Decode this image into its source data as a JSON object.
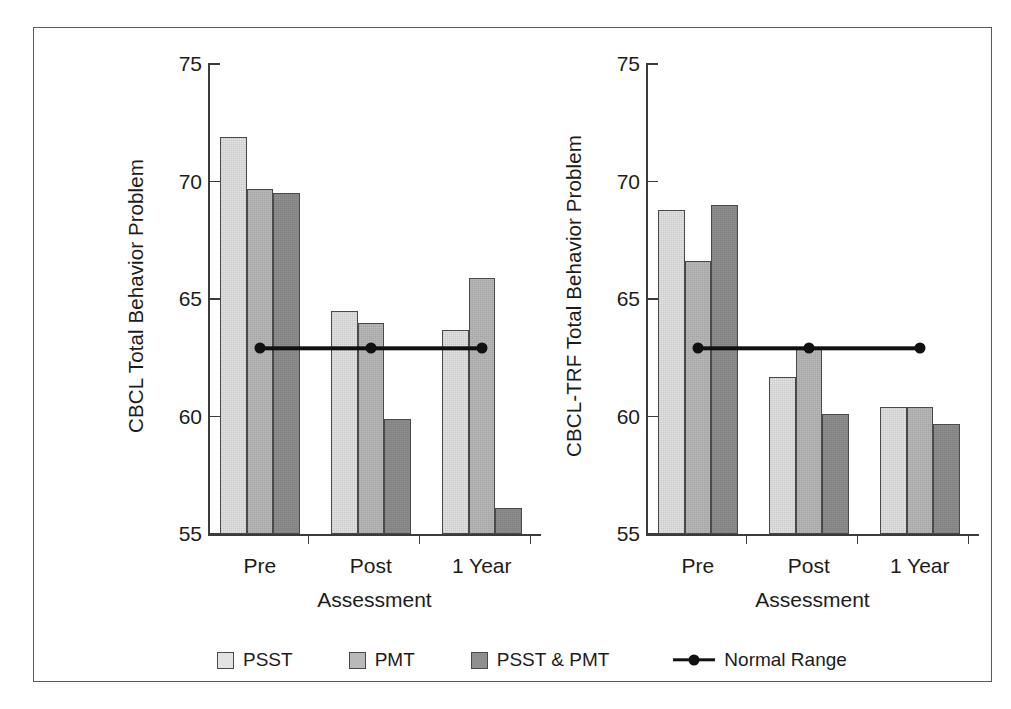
{
  "figure": {
    "background": "#ffffff",
    "frame_color": "#5a5a5a"
  },
  "legend": {
    "items": [
      {
        "key": "PSST",
        "label": "PSST",
        "color": "#e3e3e3",
        "marker": "square"
      },
      {
        "key": "PMT",
        "label": "PMT",
        "color": "#b9b9b9",
        "marker": "square"
      },
      {
        "key": "PSST & PMT",
        "label": "PSST & PMT",
        "color": "#8f8f8f",
        "marker": "square"
      },
      {
        "key": "Normal Range",
        "label": "Normal Range",
        "color": "#111111",
        "marker": "line-dot"
      }
    ]
  },
  "chart_data": [
    {
      "id": "left",
      "type": "bar",
      "title": "",
      "xlabel": "Assessment",
      "ylabel": "CBCL Total Behavior Problem",
      "categories": [
        "Pre",
        "Post",
        "1 Year"
      ],
      "yticks": [
        55,
        60,
        65,
        70,
        75
      ],
      "ylim": [
        55,
        75
      ],
      "grid": false,
      "legend_position": "below-figure",
      "series": [
        {
          "name": "PSST",
          "color": "#e3e3e3",
          "values": [
            71.9,
            64.5,
            63.7
          ]
        },
        {
          "name": "PMT",
          "color": "#b9b9b9",
          "values": [
            69.7,
            64.0,
            65.9
          ]
        },
        {
          "name": "PSST & PMT",
          "color": "#8f8f8f",
          "values": [
            69.5,
            59.9,
            56.1
          ]
        }
      ],
      "reference_line": {
        "name": "Normal Range",
        "value": 62.9,
        "color": "#111111",
        "markers_at": [
          "Pre",
          "Post",
          "1 Year"
        ]
      }
    },
    {
      "id": "right",
      "type": "bar",
      "title": "",
      "xlabel": "Assessment",
      "ylabel": "CBCL-TRF Total Behavior Problem",
      "categories": [
        "Pre",
        "Post",
        "1 Year"
      ],
      "yticks": [
        55,
        60,
        65,
        70,
        75
      ],
      "ylim": [
        55,
        75
      ],
      "grid": false,
      "legend_position": "below-figure",
      "series": [
        {
          "name": "PSST",
          "color": "#e3e3e3",
          "values": [
            68.8,
            61.7,
            60.4
          ]
        },
        {
          "name": "PMT",
          "color": "#b9b9b9",
          "values": [
            66.6,
            62.9,
            60.4
          ]
        },
        {
          "name": "PSST & PMT",
          "color": "#8f8f8f",
          "values": [
            69.0,
            60.1,
            59.7
          ]
        }
      ],
      "reference_line": {
        "name": "Normal Range",
        "value": 62.9,
        "color": "#111111",
        "markers_at": [
          "Pre",
          "Post",
          "1 Year"
        ]
      }
    }
  ]
}
